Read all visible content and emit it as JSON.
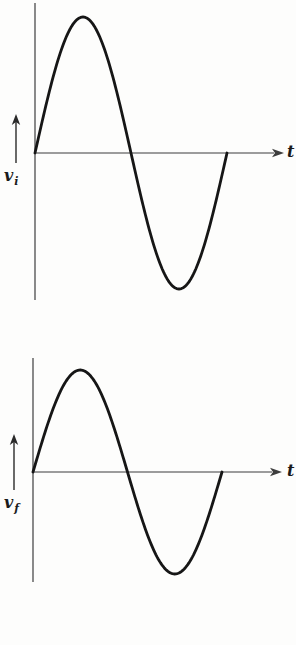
{
  "page": {
    "background": "#fdfdfc"
  },
  "chart_data": [
    {
      "id": "vi",
      "type": "line",
      "title": "",
      "xlabel": "t",
      "ylabel": {
        "base": "v",
        "sub": "i"
      },
      "waveform": {
        "shape": "sine",
        "cycles": 1,
        "phase_deg": 0,
        "amplitude": 1.0
      },
      "key_points": {
        "t_fraction_of_period": [
          0,
          0.25,
          0.5,
          0.75,
          1
        ],
        "v": [
          0,
          1,
          0,
          -1,
          0
        ]
      },
      "x_range": "one full period, axis unlabeled",
      "ylim": [
        -1,
        1
      ],
      "grid": false,
      "legend": false,
      "curve_color": "#161616",
      "axis_color": "#3d3d3d"
    },
    {
      "id": "vf",
      "type": "line",
      "title": "",
      "xlabel": "t",
      "ylabel": {
        "base": "v",
        "sub": "f"
      },
      "waveform": {
        "shape": "sine",
        "cycles": 1,
        "phase_deg": 0,
        "amplitude": 0.75
      },
      "key_points": {
        "t_fraction_of_period": [
          0,
          0.25,
          0.5,
          0.75,
          1
        ],
        "v": [
          0,
          0.75,
          0,
          -0.75,
          0
        ]
      },
      "x_range": "one full period, axis unlabeled, in phase with v_i",
      "ylim": [
        -1,
        1
      ],
      "grid": false,
      "legend": false,
      "curve_color": "#161616",
      "axis_color": "#3d3d3d"
    }
  ]
}
